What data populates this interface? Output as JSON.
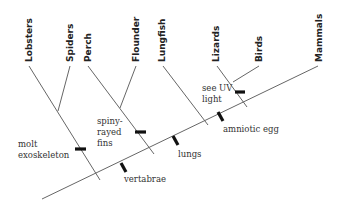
{
  "diagram": {
    "type": "cladogram",
    "taxa": [
      {
        "label": "Lobsters"
      },
      {
        "label": "Spiders"
      },
      {
        "label": "Perch"
      },
      {
        "label": "Flounder"
      },
      {
        "label": "Lungfish"
      },
      {
        "label": "Lizards"
      },
      {
        "label": "Birds"
      },
      {
        "label": "Mammals"
      }
    ],
    "traits": [
      {
        "lines": [
          "molt",
          "exoskeleton"
        ]
      },
      {
        "lines": [
          "spiny-",
          "rayed",
          "fins"
        ]
      },
      {
        "lines": [
          "vertabrae"
        ]
      },
      {
        "lines": [
          "lungs"
        ]
      },
      {
        "lines": [
          "amniotic egg"
        ]
      },
      {
        "lines": [
          "see UV",
          "light"
        ]
      }
    ],
    "colors": {
      "line": "#666666",
      "marker": "#111111",
      "text": "#222222"
    }
  }
}
